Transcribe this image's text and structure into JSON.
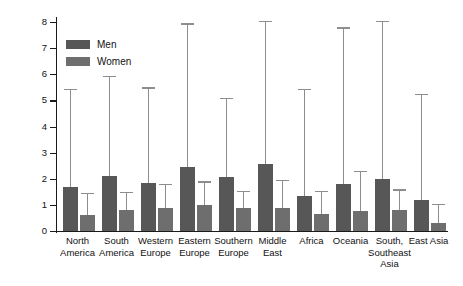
{
  "chart_data": {
    "type": "bar",
    "title": "",
    "xlabel": "",
    "ylabel": "Number of partners desired",
    "ylim": [
      0,
      8
    ],
    "yticks": [
      0,
      1,
      2,
      3,
      4,
      5,
      6,
      7,
      8
    ],
    "ytick_labels": [
      "0",
      "1",
      "2",
      "3",
      "4",
      "5",
      "6",
      "7",
      "8"
    ],
    "grid": false,
    "legend_position": "upper-left inside axes",
    "error_bars": "upper only (SD)",
    "categories": [
      "North\nAmerica",
      "South\nAmerica",
      "Western\nEurope",
      "Eastern\nEurope",
      "Southern\nEurope",
      "Middle\nEast",
      "Africa",
      "Oceania",
      "South,\nSoutheast\nAsia",
      "East Asia"
    ],
    "series": [
      {
        "name": "Men",
        "color": "#575757",
        "values": [
          1.7,
          2.1,
          1.85,
          2.45,
          2.05,
          2.55,
          1.35,
          1.8,
          2.0,
          1.2
        ],
        "error_upper": [
          5.4,
          5.9,
          5.45,
          7.9,
          5.05,
          8.0,
          5.4,
          7.75,
          8.0,
          5.2
        ]
      },
      {
        "name": "Women",
        "color": "#6e6e6e",
        "values": [
          0.6,
          0.8,
          0.9,
          1.0,
          0.9,
          0.9,
          0.65,
          0.75,
          0.8,
          0.3
        ],
        "error_upper": [
          1.4,
          1.45,
          1.75,
          1.85,
          1.5,
          1.9,
          1.5,
          2.25,
          1.55,
          1.0
        ]
      }
    ]
  },
  "legend": {
    "items": [
      {
        "label": "Men",
        "color": "#575757"
      },
      {
        "label": "Women",
        "color": "#6e6e6e"
      }
    ]
  },
  "axes": {
    "y_title": "Number of partners desired"
  }
}
